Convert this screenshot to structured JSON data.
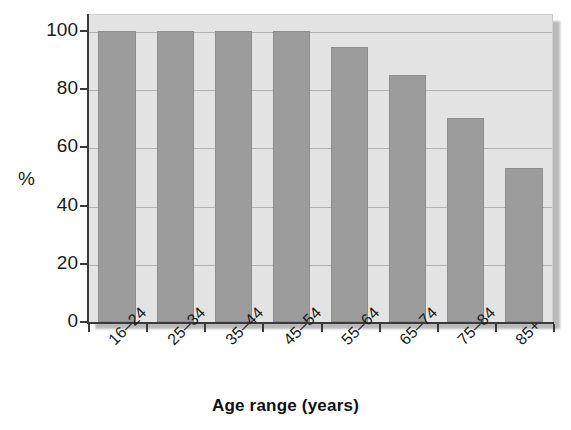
{
  "chart_data": {
    "type": "bar",
    "title": "",
    "xlabel": "Age range (years)",
    "ylabel": "%",
    "categories": [
      "16–24",
      "25–34",
      "35–44",
      "45–54",
      "55–64",
      "65–74",
      "75–84",
      "85+"
    ],
    "values": [
      100,
      100,
      100,
      100,
      94.5,
      85,
      70,
      53
    ],
    "ylim": [
      0,
      100
    ],
    "yticks": [
      0,
      20,
      40,
      60,
      80,
      100
    ],
    "ytick_labels": [
      "0",
      "20",
      "40",
      "60",
      "80",
      "100"
    ],
    "grid": true,
    "legend": "none",
    "series": [
      {
        "name": "",
        "values": [
          100,
          100,
          100,
          100,
          94.5,
          85,
          70,
          53
        ]
      }
    ],
    "colors": {
      "bar_fill": "#9c9c9c",
      "bar_stroke": "#8e8e8e",
      "panel_background": "#e3e3e3",
      "gridline": "#a9a9a9",
      "axis": "#3a3a3a",
      "text": "#1b1b1b",
      "page_background": "#ffffff"
    }
  }
}
